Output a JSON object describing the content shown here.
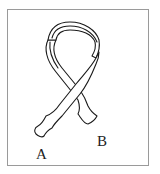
{
  "figure": {
    "labels": {
      "end_a": "A",
      "end_b": "B"
    },
    "colors": {
      "stroke": "#1a1a1a",
      "border": "#9a9a9a",
      "background": "#ffffff"
    }
  }
}
